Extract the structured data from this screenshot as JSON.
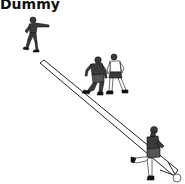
{
  "diagram": {
    "title": "Dummy",
    "elements": [
      {
        "type": "player",
        "name": "passer",
        "position": "top-left"
      },
      {
        "type": "player",
        "name": "dummy-runner",
        "position": "center"
      },
      {
        "type": "player",
        "name": "defender",
        "position": "center-right"
      },
      {
        "type": "player",
        "name": "receiver",
        "position": "bottom-right"
      },
      {
        "type": "arrow",
        "name": "pass-path",
        "from": "top-left",
        "to": "bottom-right"
      },
      {
        "type": "ball",
        "position": "bottom-right"
      }
    ],
    "colors": {
      "figure": "#3a3a3a",
      "outline": "#111111",
      "arrow_fill": "#ffffff",
      "background": "#ffffff"
    }
  }
}
